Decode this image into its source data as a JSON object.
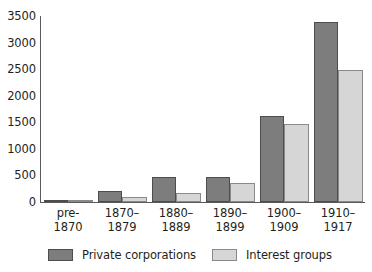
{
  "chart_data": {
    "type": "bar",
    "title": "",
    "subtitle": "",
    "xlabel": "",
    "ylabel": "",
    "categories": [
      "pre-\n1870",
      "1870–\n1879",
      "1880–\n1889",
      "1890–\n1899",
      "1900–\n1909",
      "1910–\n1917"
    ],
    "category_lines": [
      [
        "pre-",
        "1870"
      ],
      [
        "1870–",
        "1879"
      ],
      [
        "1880–",
        "1889"
      ],
      [
        "1890–",
        "1899"
      ],
      [
        "1900–",
        "1909"
      ],
      [
        "1910–",
        "1917"
      ]
    ],
    "series": [
      {
        "name": "Private corporations",
        "color": "#7d7d7d",
        "values": [
          30,
          215,
          480,
          470,
          1620,
          3390
        ]
      },
      {
        "name": "Interest groups",
        "color": "#d6d6d6",
        "values": [
          15,
          90,
          165,
          360,
          1460,
          2490
        ]
      }
    ],
    "ylim": [
      0,
      3500
    ],
    "ytick_step": 500,
    "yticks": [
      0,
      500,
      1000,
      1500,
      2000,
      2500,
      3000,
      3500
    ],
    "ytick_labels": [
      "0",
      "500",
      "1000",
      "1500",
      "2000",
      "2500",
      "3000",
      "3500"
    ],
    "grid": false,
    "legend_position": "bottom",
    "legend_entries": [
      "Private corporations",
      "Interest groups"
    ],
    "annotations": []
  },
  "colors": {
    "series_private_corporations": "#7d7d7d",
    "series_interest_groups": "#d6d6d6",
    "axis": "#58595b",
    "text": "#231f20",
    "background": "#ffffff"
  }
}
